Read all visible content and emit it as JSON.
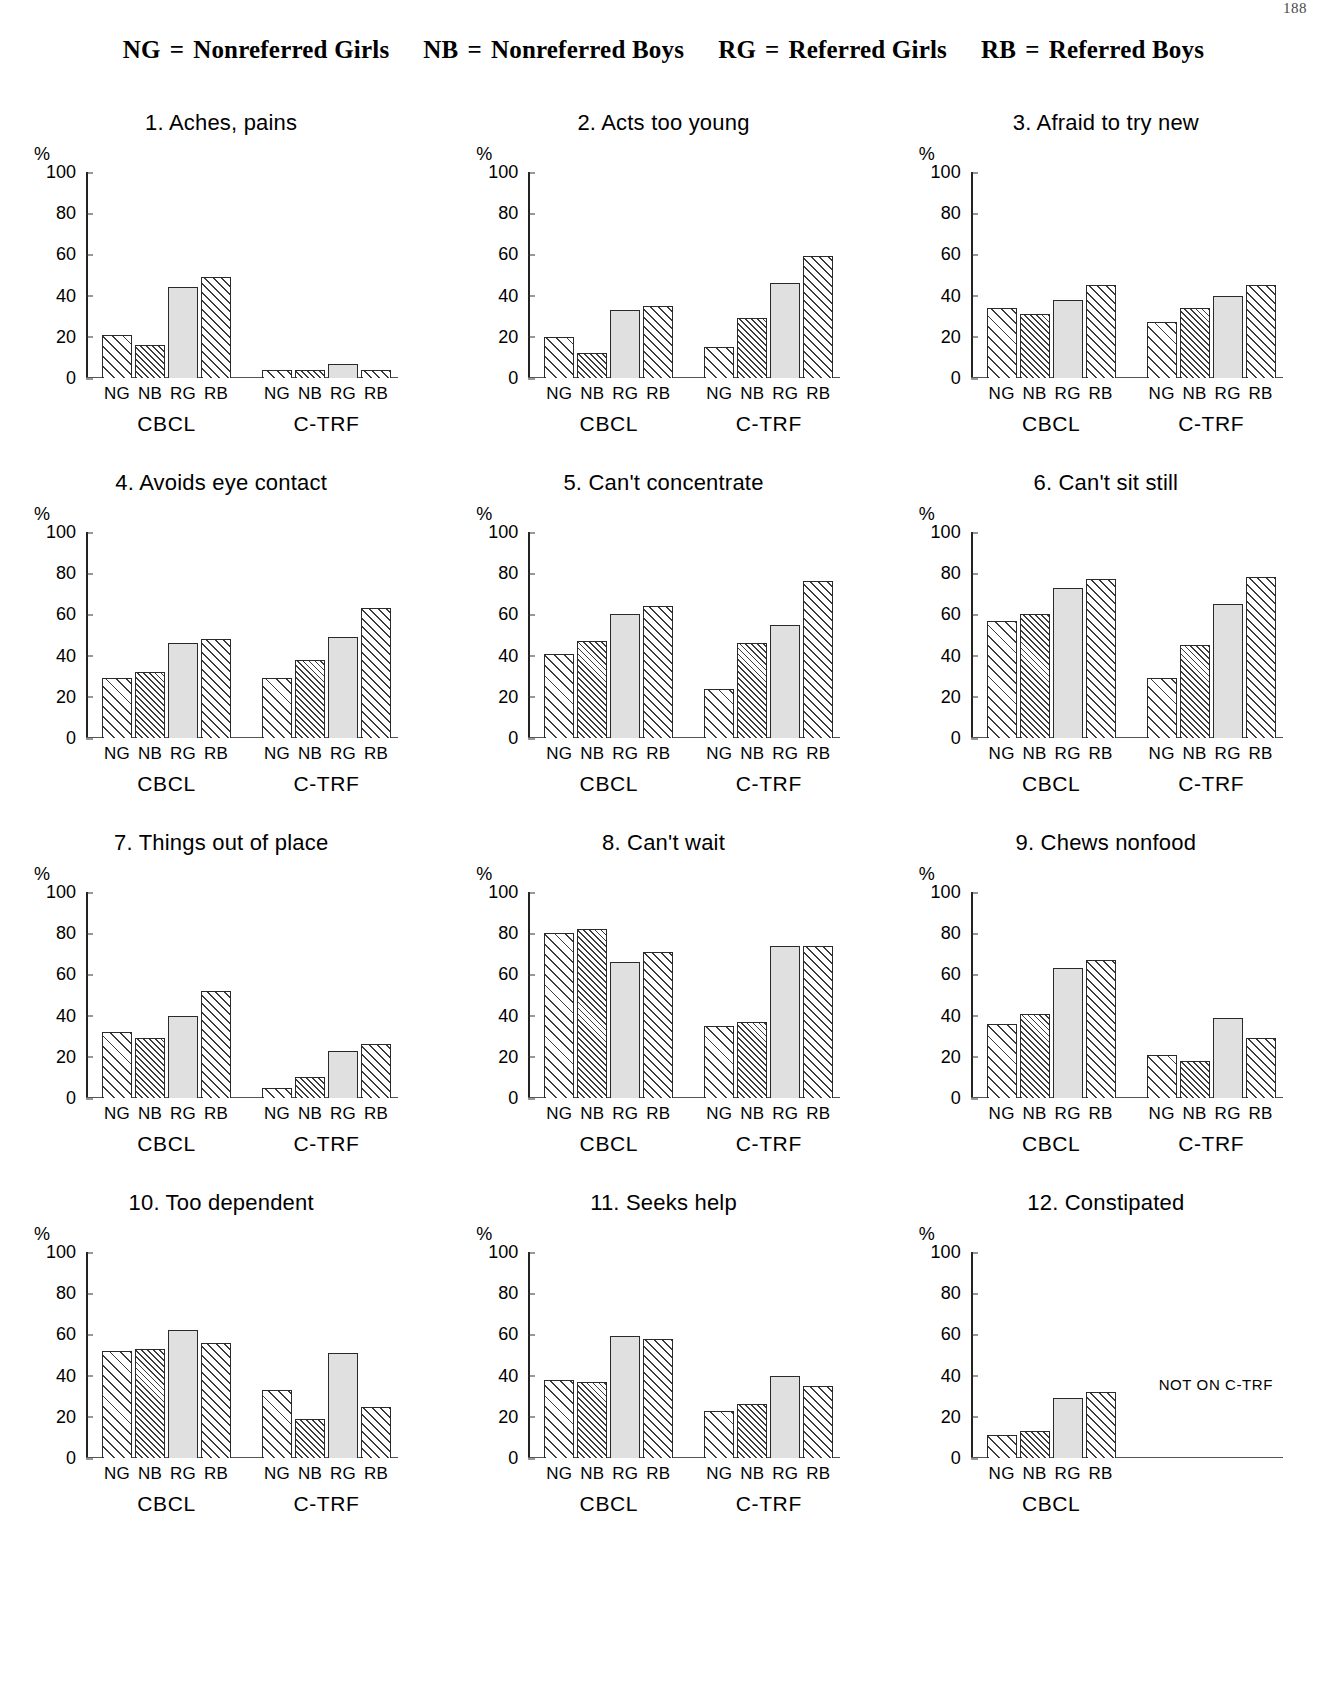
{
  "page_number": "188",
  "legend": {
    "entries": [
      {
        "code": "NG",
        "eq": "=",
        "desc": "Nonreferred Girls"
      },
      {
        "code": "NB",
        "eq": "=",
        "desc": "Nonreferred Boys"
      },
      {
        "code": "RG",
        "eq": "=",
        "desc": "Referred Girls"
      },
      {
        "code": "RB",
        "eq": "=",
        "desc": "Referred Boys"
      }
    ]
  },
  "axis": {
    "percent_symbol": "%",
    "yticks": [
      "100",
      "80",
      "60",
      "40",
      "20",
      "0"
    ],
    "ytick_values": [
      100,
      80,
      60,
      40,
      20,
      0
    ],
    "ylim": [
      0,
      100
    ],
    "group_labels": [
      "CBCL",
      "C-TRF"
    ],
    "bar_labels": [
      "NG",
      "NB",
      "RG",
      "RB"
    ]
  },
  "chart_data": [
    {
      "type": "bar",
      "title": "1. Aches, pains",
      "xlabel": "",
      "ylabel": "%",
      "ylim": [
        0,
        100
      ],
      "grid": false,
      "categories": [
        "NG",
        "NB",
        "RG",
        "RB"
      ],
      "groups": [
        "CBCL",
        "C-TRF"
      ],
      "series": [
        {
          "name": "CBCL",
          "values": [
            21,
            16,
            44,
            49
          ]
        },
        {
          "name": "C-TRF",
          "values": [
            4,
            4,
            7,
            4
          ]
        }
      ]
    },
    {
      "type": "bar",
      "title": "2. Acts too young",
      "xlabel": "",
      "ylabel": "%",
      "ylim": [
        0,
        100
      ],
      "grid": false,
      "categories": [
        "NG",
        "NB",
        "RG",
        "RB"
      ],
      "groups": [
        "CBCL",
        "C-TRF"
      ],
      "series": [
        {
          "name": "CBCL",
          "values": [
            20,
            12,
            33,
            35
          ]
        },
        {
          "name": "C-TRF",
          "values": [
            15,
            29,
            46,
            59
          ]
        }
      ]
    },
    {
      "type": "bar",
      "title": "3. Afraid to try new",
      "xlabel": "",
      "ylabel": "%",
      "ylim": [
        0,
        100
      ],
      "grid": false,
      "categories": [
        "NG",
        "NB",
        "RG",
        "RB"
      ],
      "groups": [
        "CBCL",
        "C-TRF"
      ],
      "series": [
        {
          "name": "CBCL",
          "values": [
            34,
            31,
            38,
            45
          ]
        },
        {
          "name": "C-TRF",
          "values": [
            27,
            34,
            40,
            45
          ]
        }
      ]
    },
    {
      "type": "bar",
      "title": "4. Avoids eye contact",
      "xlabel": "",
      "ylabel": "%",
      "ylim": [
        0,
        100
      ],
      "grid": false,
      "categories": [
        "NG",
        "NB",
        "RG",
        "RB"
      ],
      "groups": [
        "CBCL",
        "C-TRF"
      ],
      "series": [
        {
          "name": "CBCL",
          "values": [
            29,
            32,
            46,
            48
          ]
        },
        {
          "name": "C-TRF",
          "values": [
            29,
            38,
            49,
            63
          ]
        }
      ]
    },
    {
      "type": "bar",
      "title": "5. Can't concentrate",
      "xlabel": "",
      "ylabel": "%",
      "ylim": [
        0,
        100
      ],
      "grid": false,
      "categories": [
        "NG",
        "NB",
        "RG",
        "RB"
      ],
      "groups": [
        "CBCL",
        "C-TRF"
      ],
      "series": [
        {
          "name": "CBCL",
          "values": [
            41,
            47,
            60,
            64
          ]
        },
        {
          "name": "C-TRF",
          "values": [
            24,
            46,
            55,
            76
          ]
        }
      ]
    },
    {
      "type": "bar",
      "title": "6. Can't sit still",
      "xlabel": "",
      "ylabel": "%",
      "ylim": [
        0,
        100
      ],
      "grid": false,
      "categories": [
        "NG",
        "NB",
        "RG",
        "RB"
      ],
      "groups": [
        "CBCL",
        "C-TRF"
      ],
      "series": [
        {
          "name": "CBCL",
          "values": [
            57,
            60,
            73,
            77
          ]
        },
        {
          "name": "C-TRF",
          "values": [
            29,
            45,
            65,
            78
          ]
        }
      ]
    },
    {
      "type": "bar",
      "title": "7. Things out of place",
      "xlabel": "",
      "ylabel": "%",
      "ylim": [
        0,
        100
      ],
      "grid": false,
      "categories": [
        "NG",
        "NB",
        "RG",
        "RB"
      ],
      "groups": [
        "CBCL",
        "C-TRF"
      ],
      "series": [
        {
          "name": "CBCL",
          "values": [
            32,
            29,
            40,
            52
          ]
        },
        {
          "name": "C-TRF",
          "values": [
            5,
            10,
            23,
            26
          ]
        }
      ]
    },
    {
      "type": "bar",
      "title": "8. Can't wait",
      "xlabel": "",
      "ylabel": "%",
      "ylim": [
        0,
        100
      ],
      "grid": false,
      "categories": [
        "NG",
        "NB",
        "RG",
        "RB"
      ],
      "groups": [
        "CBCL",
        "C-TRF"
      ],
      "series": [
        {
          "name": "CBCL",
          "values": [
            80,
            82,
            66,
            71
          ]
        },
        {
          "name": "C-TRF",
          "values": [
            35,
            37,
            74,
            74
          ]
        }
      ]
    },
    {
      "type": "bar",
      "title": "9. Chews nonfood",
      "xlabel": "",
      "ylabel": "%",
      "ylim": [
        0,
        100
      ],
      "grid": false,
      "categories": [
        "NG",
        "NB",
        "RG",
        "RB"
      ],
      "groups": [
        "CBCL",
        "C-TRF"
      ],
      "series": [
        {
          "name": "CBCL",
          "values": [
            36,
            41,
            63,
            67
          ]
        },
        {
          "name": "C-TRF",
          "values": [
            21,
            18,
            39,
            29
          ]
        }
      ]
    },
    {
      "type": "bar",
      "title": "10. Too dependent",
      "xlabel": "",
      "ylabel": "%",
      "ylim": [
        0,
        100
      ],
      "grid": false,
      "categories": [
        "NG",
        "NB",
        "RG",
        "RB"
      ],
      "groups": [
        "CBCL",
        "C-TRF"
      ],
      "series": [
        {
          "name": "CBCL",
          "values": [
            52,
            53,
            62,
            56
          ]
        },
        {
          "name": "C-TRF",
          "values": [
            33,
            19,
            51,
            25
          ]
        }
      ]
    },
    {
      "type": "bar",
      "title": "11. Seeks help",
      "xlabel": "",
      "ylabel": "%",
      "ylim": [
        0,
        100
      ],
      "grid": false,
      "categories": [
        "NG",
        "NB",
        "RG",
        "RB"
      ],
      "groups": [
        "CBCL",
        "C-TRF"
      ],
      "series": [
        {
          "name": "CBCL",
          "values": [
            38,
            37,
            59,
            58
          ]
        },
        {
          "name": "C-TRF",
          "values": [
            23,
            26,
            40,
            35
          ]
        }
      ]
    },
    {
      "type": "bar",
      "title": "12. Constipated",
      "xlabel": "",
      "ylabel": "%",
      "ylim": [
        0,
        100
      ],
      "grid": false,
      "categories": [
        "NG",
        "NB",
        "RG",
        "RB"
      ],
      "groups": [
        "CBCL"
      ],
      "note": "NOT ON C-TRF",
      "series": [
        {
          "name": "CBCL",
          "values": [
            11,
            13,
            29,
            32
          ]
        }
      ]
    }
  ]
}
